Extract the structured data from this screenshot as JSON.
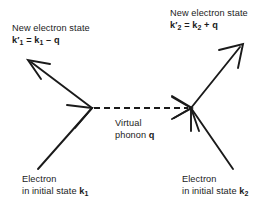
{
  "diagram": {
    "type": "feynman-diagram",
    "background_color": "#ffffff",
    "line_color": "#1a1a1a",
    "labels": {
      "new_state_left": {
        "line1": "New electron state",
        "formula_prefix": "k",
        "formula_prime": "′",
        "formula_sub1": "1",
        "formula_eq": " = ",
        "formula_k2": "k",
        "formula_sub2": "1",
        "formula_op": " – ",
        "formula_q": "q",
        "formula_full": "k′1 = k1 – q"
      },
      "new_state_right": {
        "line1": "New electron state",
        "formula_prefix": "k",
        "formula_prime": "′",
        "formula_sub1": "2",
        "formula_eq": " = ",
        "formula_k2": "k",
        "formula_sub2": "2",
        "formula_op": " + ",
        "formula_q": "q",
        "formula_full": "k′2 = k2 + q"
      },
      "virtual_phonon": {
        "line1": "Virtual",
        "line2_prefix": "phonon ",
        "line2_symbol": "q",
        "full": "Virtual phonon q"
      },
      "electron_left": {
        "line1": "Electron",
        "line2_prefix": "in initial state ",
        "line2_symbol": "k",
        "line2_sub": "1",
        "full": "Electron in initial state k1"
      },
      "electron_right": {
        "line1": "Electron",
        "line2_prefix": "in initial state ",
        "line2_symbol": "k",
        "line2_sub": "2",
        "full": "Electron in initial state k2"
      }
    },
    "geometry": {
      "vertex_left": {
        "x": 92,
        "y": 108
      },
      "vertex_right": {
        "x": 191,
        "y": 108
      },
      "outgoing_left_tip": {
        "x": 28,
        "y": 60
      },
      "outgoing_right_tip": {
        "x": 243,
        "y": 44
      },
      "incoming_left_start": {
        "x": 38,
        "y": 169
      },
      "incoming_right_start": {
        "x": 233,
        "y": 169
      },
      "phonon_dash_pattern": "6 4"
    }
  }
}
